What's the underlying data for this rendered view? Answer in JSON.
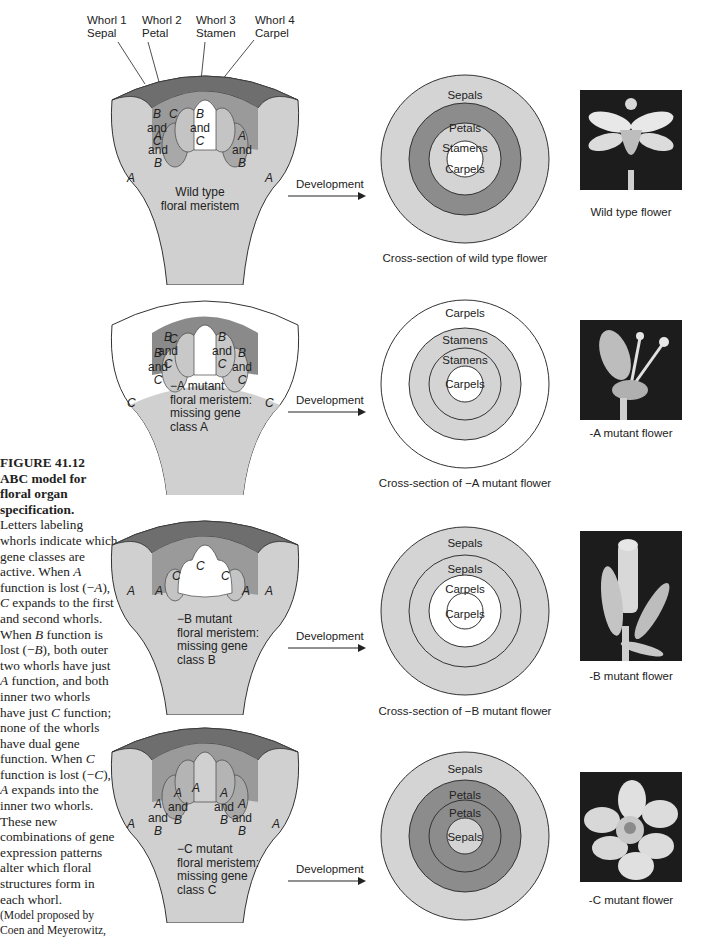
{
  "caption": {
    "figure_number": "FIGURE 41.12",
    "title": "ABC model for floral organ specification.",
    "body_parts": [
      "Letters labeling whorls indicate which gene classes are active. When ",
      "A",
      " function is lost (−",
      "A",
      "), ",
      "C",
      " expands to the first and second whorls. When ",
      "B",
      " function is lost (−",
      "B",
      "), both outer two whorls have just ",
      "A",
      " function, and both inner two whorls have just ",
      "C",
      " function; none of the whorls have dual gene function. When ",
      "C",
      " function is lost (−",
      "C",
      "), ",
      "A",
      " expands into the inner two whorls. These new combinations of gene expression patterns alter which floral structures form in each whorl."
    ],
    "credit": "(Model proposed by Coen and Meyerowitz,"
  },
  "whorl_headers": [
    {
      "line1": "Whorl 1",
      "line2": "Sepal"
    },
    {
      "line1": "Whorl 2",
      "line2": "Petal"
    },
    {
      "line1": "Whorl 3",
      "line2": "Stamen"
    },
    {
      "line1": "Whorl 4",
      "line2": "Carpel"
    }
  ],
  "arrow_label": "Development",
  "panels": [
    {
      "id": "wild",
      "meristem_labels": {
        "outer": "A",
        "w2": [
          "A",
          "and",
          "B"
        ],
        "w3": [
          "B",
          "and",
          "C"
        ],
        "center": "C"
      },
      "meristem_text": [
        "Wild type",
        "floral meristem"
      ],
      "rings": [
        "Sepals",
        "Petals",
        "Stamens",
        "Carpels"
      ],
      "cross_section_caption": "Cross-section of wild type flower",
      "photo_caption": "Wild type flower"
    },
    {
      "id": "minusA",
      "meristem_labels": {
        "outer": "C",
        "w2": [
          "B",
          "and",
          "C"
        ],
        "w3": [
          "B",
          "and",
          "C"
        ],
        "center": "C"
      },
      "meristem_text": [
        "−A mutant",
        "floral meristem:",
        "missing gene",
        "class A"
      ],
      "rings": [
        "Carpels",
        "Stamens",
        "Stamens",
        "Carpels"
      ],
      "cross_section_caption": "Cross-section of −A mutant flower",
      "photo_caption": "-A mutant flower"
    },
    {
      "id": "minusB",
      "meristem_labels": {
        "outer": "A",
        "w2": [
          "A"
        ],
        "w3": [
          "C"
        ],
        "center": "C"
      },
      "meristem_text": [
        "−B mutant",
        "floral meristem:",
        "missing gene",
        "class B"
      ],
      "rings": [
        "Sepals",
        "Sepals",
        "Carpels",
        "Carpels"
      ],
      "cross_section_caption": "Cross-section of −B mutant flower",
      "photo_caption": "-B mutant flower"
    },
    {
      "id": "minusC",
      "meristem_labels": {
        "outer": "A",
        "w2": [
          "A",
          "and",
          "B"
        ],
        "w3": [
          "A",
          "and",
          "B"
        ],
        "center": "A"
      },
      "meristem_text": [
        "−C mutant",
        "floral meristem:",
        "missing gene",
        "class C"
      ],
      "rings": [
        "Sepals",
        "Petals",
        "Petals",
        "Sepals"
      ],
      "cross_section_caption": "",
      "photo_caption": "-C mutant flower"
    }
  ],
  "colors": {
    "sepal_fill": "#d4d4d4",
    "petal_fill": "#8c8c8c",
    "stamen_fill": "#d4d4d4",
    "carpel_fill": "#ffffff",
    "meristem_body": "#d0d0d0",
    "meristem_rim": "#6e6e6e",
    "photo_bg": "#1c1c1c"
  }
}
